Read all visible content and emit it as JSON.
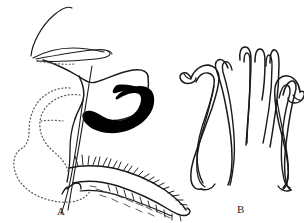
{
  "figure": {
    "kind": "scientific-line-drawing",
    "background_color": "#ffffff",
    "ink_color": "#1a1a1a",
    "fill_color": "#000000",
    "stipple_color": "#5b5b5b",
    "width": 304,
    "height": 223
  },
  "panels": [
    {
      "id": "A",
      "label": "A",
      "label_x": 57,
      "label_y": 206,
      "view": "lateral",
      "features": [
        "long slender apical filaments",
        "solid black sclerotized hook",
        "stippled membranous lobe outline",
        "setose elongate appendage with marginal bristles"
      ]
    },
    {
      "id": "B",
      "label": "B",
      "label_x": 237,
      "label_y": 204,
      "view": "ventral",
      "features": [
        "paired lateral hooks with recurved apices",
        "central bifid median lobe",
        "symmetrical outline"
      ]
    }
  ]
}
